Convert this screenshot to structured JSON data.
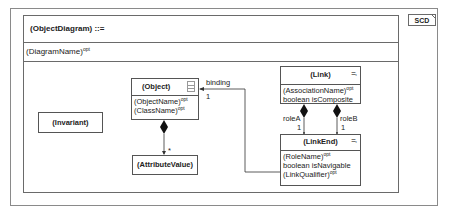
{
  "diagram": {
    "tag": "SCD",
    "header": {
      "name": "(ObjectDiagram)",
      "operator": " ::="
    },
    "name_row": {
      "name": "(DiagramName)",
      "suffix": "opt"
    },
    "classes": {
      "invariant": {
        "title": "(Invariant)"
      },
      "object": {
        "title": "(Object)",
        "attributes": [
          {
            "name": "(ObjectName)",
            "suffix": "opt"
          },
          {
            "name": "(ClassName)",
            "suffix": "opt"
          }
        ]
      },
      "attribute_value": {
        "title": "(AttributeValue)"
      },
      "link": {
        "title": "(Link)",
        "attributes": [
          {
            "name": "(AssociationName)",
            "suffix": "opt"
          },
          {
            "name": "boolean isComposite",
            "suffix": ""
          }
        ]
      },
      "link_end": {
        "title": "(LinkEnd)",
        "attributes": [
          {
            "name": "(RoleName)",
            "suffix": "opt"
          },
          {
            "name": "boolean isNavigable",
            "suffix": ""
          },
          {
            "name": "(LinkQualifier)",
            "suffix": "opt"
          }
        ]
      }
    },
    "connectors": {
      "binding": {
        "label": "binding",
        "multiplicity": "1"
      },
      "attribute_values": {
        "multiplicity": "*"
      },
      "role_a": {
        "label": "roleA",
        "multiplicity": "1"
      },
      "role_b": {
        "label": "roleB",
        "multiplicity": "1"
      }
    }
  }
}
